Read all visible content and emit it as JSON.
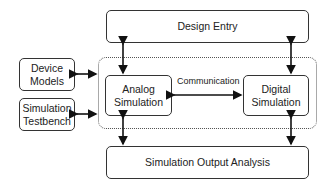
{
  "diagram": {
    "nodes": {
      "design_entry": "Design Entry",
      "device_models": "Device\nModels",
      "simulation_testbench": "Simulation\nTestbench",
      "analog_simulation": "Analog\nSimulation",
      "digital_simulation": "Digital\nSimulation",
      "output_analysis": "Simulation Output Analysis"
    },
    "edge_labels": {
      "communication": "Communication"
    },
    "edges": [
      {
        "from": "design_entry",
        "to": "analog_simulation",
        "type": "bidirectional"
      },
      {
        "from": "design_entry",
        "to": "digital_simulation",
        "type": "bidirectional"
      },
      {
        "from": "analog_simulation",
        "to": "digital_simulation",
        "type": "bidirectional",
        "label": "Communication"
      },
      {
        "from": "device_models",
        "to": "simulation_group",
        "type": "bidirectional"
      },
      {
        "from": "simulation_testbench",
        "to": "simulation_group",
        "type": "bidirectional"
      },
      {
        "from": "analog_simulation",
        "to": "output_analysis",
        "type": "bidirectional"
      },
      {
        "from": "digital_simulation",
        "to": "output_analysis",
        "type": "bidirectional"
      }
    ]
  }
}
